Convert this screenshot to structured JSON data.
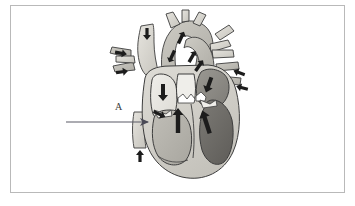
{
  "figure": {
    "kind": "anatomical-diagram",
    "background_color": "#ffffff",
    "frame": {
      "border_color": "#b9b9b9",
      "x": 10,
      "y": 5,
      "width": 335,
      "height": 188
    }
  },
  "labels": [
    {
      "id": "A",
      "text": "A",
      "x": 115,
      "y": 101,
      "color": "#3a3a3a",
      "leader_line": {
        "x1": 66,
        "y1": 122,
        "x2": 148,
        "y2": 122,
        "color": "#5a5a66"
      }
    }
  ],
  "palette": {
    "outline": "#3d3d3d",
    "myocardium_light": "#d8d6d0",
    "myocardium_mid": "#c2c0b9",
    "chamber_light": "#e8e7e2",
    "chamber_pale": "#efeeea",
    "chamber_mid_gray": "#b4b2ab",
    "chamber_dark_gray": "#8d8b85",
    "chamber_darkest": "#6f6d68",
    "vessel_gray": "#b9b7b0",
    "vessel_light": "#d2d0c9",
    "arrow_black": "#1c1c1c",
    "leader_gray": "#5a5a66",
    "frame_gray": "#b9b9b9"
  },
  "structures": [
    {
      "name": "aorta-arch",
      "tone": "#c9c7c0"
    },
    {
      "name": "brachiocephalic-branches",
      "tone": "#d2d0c9"
    },
    {
      "name": "superior-vena-cava",
      "tone": "#dddbd4"
    },
    {
      "name": "pulmonary-artery",
      "tone": "#cdcbc4"
    },
    {
      "name": "right-pulmonary-veins",
      "tone": "#b9b7b0"
    },
    {
      "name": "left-pulmonary-veins",
      "tone": "#b9b7b0"
    },
    {
      "name": "inferior-vena-cava",
      "tone": "#dddbd4"
    },
    {
      "name": "right-atrium",
      "tone": "#e8e7e2"
    },
    {
      "name": "left-atrium",
      "tone": "#8d8b85"
    },
    {
      "name": "right-ventricle",
      "tone": "#b4b2ab"
    },
    {
      "name": "left-ventricle",
      "tone": "#6f6d68"
    },
    {
      "name": "interventricular-septum",
      "tone": "#d8d6d0"
    },
    {
      "name": "tricuspid-valve",
      "tone": "#efeeea"
    },
    {
      "name": "mitral-valve",
      "tone": "#efeeea"
    },
    {
      "name": "aortic-valve-cusps",
      "tone": "#ffffff"
    },
    {
      "name": "pulmonary-valve-cusps",
      "tone": "#ffffff"
    }
  ],
  "flow_arrows": [
    {
      "name": "svc-inflow-arrow",
      "direction": "down",
      "x": 147,
      "y": 33,
      "angle": 90
    },
    {
      "name": "left-pulmonary-vein-arrow-upper",
      "direction": "right",
      "x": 120,
      "y": 53,
      "angle": 10
    },
    {
      "name": "left-pulmonary-vein-arrow-lower",
      "direction": "right",
      "x": 121,
      "y": 72,
      "angle": -8
    },
    {
      "name": "right-pulmonary-vein-arrow-upper",
      "direction": "left",
      "x": 240,
      "y": 73,
      "angle": 200
    },
    {
      "name": "right-pulmonary-vein-arrow-lower",
      "direction": "left",
      "x": 243,
      "y": 88,
      "angle": 195
    },
    {
      "name": "aortic-outflow-arrow",
      "direction": "up-left",
      "x": 181,
      "y": 38,
      "angle": -65
    },
    {
      "name": "aortic-arch-arrow",
      "direction": "down-left",
      "x": 172,
      "y": 56,
      "angle": 115
    },
    {
      "name": "pulmonary-trunk-arrow",
      "direction": "up-right",
      "x": 192,
      "y": 57,
      "angle": -60
    },
    {
      "name": "pulmonary-trunk-arrow-2",
      "direction": "up-right",
      "x": 199,
      "y": 66,
      "angle": -55
    },
    {
      "name": "right-atrium-inflow-arrow",
      "direction": "down",
      "x": 163,
      "y": 92,
      "angle": 90
    },
    {
      "name": "left-atrium-inflow-arrow",
      "direction": "down-left",
      "x": 209,
      "y": 84,
      "angle": 110
    },
    {
      "name": "tricuspid-flow-arrow",
      "direction": "right",
      "x": 159,
      "y": 114,
      "angle": 25
    },
    {
      "name": "right-ventricle-outflow-arrow",
      "direction": "up",
      "x": 178,
      "y": 120,
      "angle": -90
    },
    {
      "name": "left-ventricle-outflow-arrow",
      "direction": "up-left",
      "x": 206,
      "y": 122,
      "angle": -108
    },
    {
      "name": "ivc-inflow-arrow",
      "direction": "up",
      "x": 140,
      "y": 157,
      "angle": -90
    }
  ]
}
